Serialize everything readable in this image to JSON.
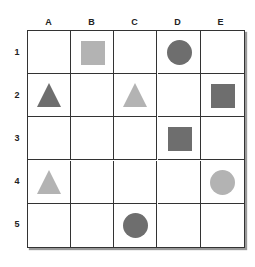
{
  "columns": [
    "A",
    "B",
    "C",
    "D",
    "E"
  ],
  "rows": [
    "1",
    "2",
    "3",
    "4",
    "5"
  ],
  "colors": {
    "dark": "#6e6e6e",
    "light": "#b3b3b3",
    "grid_line": "#333333"
  },
  "shapes": [
    {
      "row": 1,
      "col": "B",
      "shape": "square",
      "shade": "light"
    },
    {
      "row": 1,
      "col": "D",
      "shape": "circle",
      "shade": "dark"
    },
    {
      "row": 2,
      "col": "A",
      "shape": "triangle",
      "shade": "dark"
    },
    {
      "row": 2,
      "col": "C",
      "shape": "triangle",
      "shade": "light"
    },
    {
      "row": 2,
      "col": "E",
      "shape": "square",
      "shade": "dark"
    },
    {
      "row": 3,
      "col": "D",
      "shape": "square",
      "shade": "dark"
    },
    {
      "row": 4,
      "col": "A",
      "shape": "triangle",
      "shade": "light"
    },
    {
      "row": 4,
      "col": "E",
      "shape": "circle",
      "shade": "light"
    },
    {
      "row": 5,
      "col": "C",
      "shape": "circle",
      "shade": "dark"
    }
  ]
}
